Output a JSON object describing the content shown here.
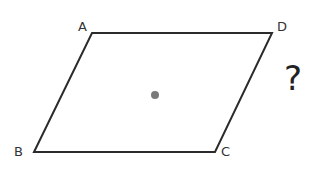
{
  "diagram": {
    "type": "parallelogram",
    "stroke_color": "#2b2b2b",
    "vertices": [
      {
        "name": "A",
        "x": 92,
        "y": 33,
        "label_x": 78,
        "label_y": 31
      },
      {
        "name": "D",
        "x": 272,
        "y": 33,
        "label_x": 277,
        "label_y": 31
      },
      {
        "name": "C",
        "x": 215,
        "y": 152,
        "label_x": 221,
        "label_y": 156
      },
      {
        "name": "B",
        "x": 34,
        "y": 152,
        "label_x": 14,
        "label_y": 156
      }
    ],
    "center_point": {
      "x": 155,
      "y": 95,
      "radius": 4,
      "color": "#7a7a7a"
    },
    "question_mark": {
      "text": "?",
      "x": 284,
      "y": 90
    }
  }
}
